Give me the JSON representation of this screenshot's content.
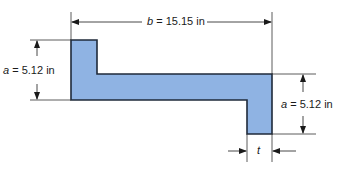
{
  "diagram": {
    "type": "z-section cross-section",
    "fill_color": "#8fb3e3",
    "outline_color": "#1f2a3a",
    "dimensions": {
      "b": {
        "var": "b",
        "text": " = 15.15 in"
      },
      "a_left": {
        "var": "a",
        "text": " = 5.12 in"
      },
      "a_right": {
        "var": "a",
        "text": " = 5.12 in"
      },
      "t": {
        "var": "t",
        "text": ""
      }
    }
  }
}
